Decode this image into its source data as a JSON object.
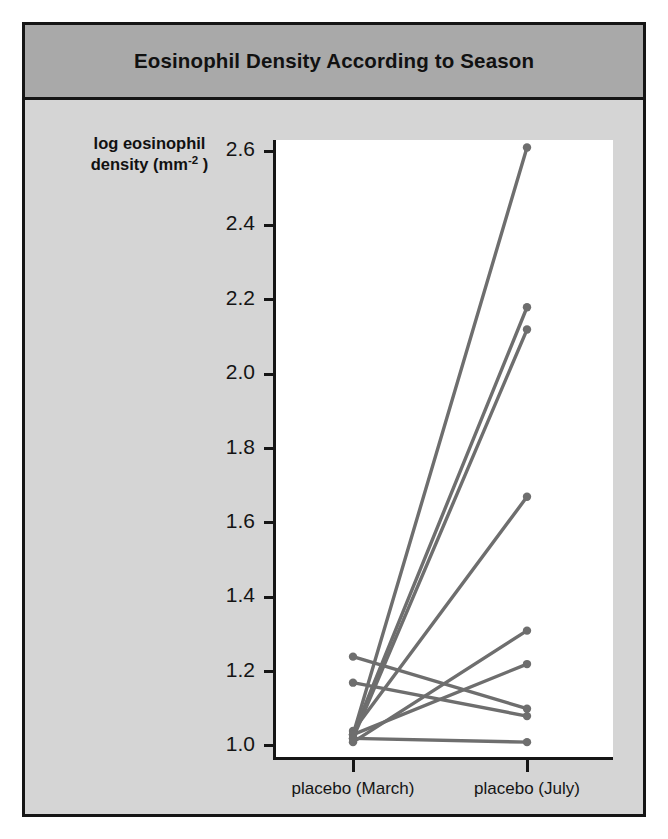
{
  "figure": {
    "title": "Eosinophil Density According to Season",
    "background_color": "#d5d5d5",
    "title_band_color": "#a9a9a9",
    "border_color": "#151515",
    "plot_background": "#ffffff"
  },
  "chart_data": {
    "type": "line",
    "title": "Eosinophil Density According to Season",
    "subtitle": "",
    "xlabel": "",
    "ylabel": "log eosinophil density (mm−2 )",
    "ylabel_lines": [
      "log eosinophil",
      "density (mm",
      "-2",
      " )"
    ],
    "categories": [
      "placebo (March)",
      "placebo (July)"
    ],
    "xtick_labels": [
      "placebo (March)",
      "placebo (July)"
    ],
    "ytick_labels": [
      "1.0",
      "1.2",
      "1.4",
      "1.6",
      "1.8",
      "2.0",
      "2.2",
      "2.4",
      "2.6"
    ],
    "ytick_values": [
      1.0,
      1.2,
      1.4,
      1.6,
      1.8,
      2.0,
      2.2,
      2.4,
      2.6
    ],
    "ylim": [
      0.97,
      2.63
    ],
    "xlim": [
      0,
      1
    ],
    "grid": false,
    "legend": "none",
    "series_color": "#6e6e6e",
    "marker": "circle",
    "style": "paired slope / spaghetti plot",
    "series": [
      {
        "name": "subject 1",
        "values": [
          1.03,
          2.61
        ]
      },
      {
        "name": "subject 2",
        "values": [
          1.03,
          2.18
        ]
      },
      {
        "name": "subject 3",
        "values": [
          1.02,
          2.12
        ]
      },
      {
        "name": "subject 4",
        "values": [
          1.04,
          1.67
        ]
      },
      {
        "name": "subject 5",
        "values": [
          1.01,
          1.31
        ]
      },
      {
        "name": "subject 6",
        "values": [
          1.03,
          1.22
        ]
      },
      {
        "name": "subject 7",
        "values": [
          1.24,
          1.1
        ]
      },
      {
        "name": "subject 8",
        "values": [
          1.17,
          1.08
        ]
      },
      {
        "name": "subject 9",
        "values": [
          1.02,
          1.01
        ]
      }
    ],
    "n_subjects": 9,
    "points": {
      "placebo (March)": [
        1.03,
        1.03,
        1.02,
        1.04,
        1.01,
        1.03,
        1.24,
        1.17,
        1.02
      ],
      "placebo (July)": [
        2.61,
        2.18,
        2.12,
        1.67,
        1.31,
        1.22,
        1.1,
        1.08,
        1.01
      ]
    }
  }
}
